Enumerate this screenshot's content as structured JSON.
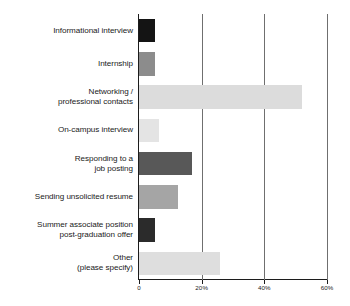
{
  "chart_data": {
    "type": "bar",
    "orientation": "horizontal",
    "title": "",
    "subtitle": "",
    "xlabel": "",
    "ylabel": "",
    "xlim": [
      0,
      60
    ],
    "grid": true,
    "legend": false,
    "legend_position": "none",
    "xtick_labels": [
      "0",
      "20%",
      "40%",
      "60%"
    ],
    "xtick_values": [
      0,
      20,
      40,
      60
    ],
    "categories": [
      "Informational interview",
      "Internship",
      "Networking /\nprofessional contacts",
      "On-campus interview",
      "Responding to a\njob posting",
      "Sending unsolicited resume",
      "Summer associate position\npost-graduation offer",
      "Other\n(please specify)"
    ],
    "values": [
      5,
      5,
      52,
      6.5,
      17,
      12.5,
      5,
      26
    ],
    "bar_colors": [
      "#141414",
      "#8c8c8c",
      "#dcdcdc",
      "#e4e4e4",
      "#585858",
      "#a5a5a5",
      "#2b2b2b",
      "#dedede"
    ],
    "axis_color": "#1c1c1c",
    "grid_color": "#6f6f6f",
    "background_color": "#ffffff"
  },
  "labels": {
    "items": [
      {
        "line1": "Informational interview",
        "line2": ""
      },
      {
        "line1": "Internship",
        "line2": ""
      },
      {
        "line1": "Networking /",
        "line2": "professional contacts"
      },
      {
        "line1": "On-campus interview",
        "line2": ""
      },
      {
        "line1": "Responding to a",
        "line2": "job posting"
      },
      {
        "line1": "Sending unsolicited resume",
        "line2": ""
      },
      {
        "line1": "Summer associate position",
        "line2": "post-graduation offer"
      },
      {
        "line1": "Other",
        "line2": "(please specify)"
      }
    ]
  },
  "axis": {
    "ticks": [
      {
        "label": "0",
        "value": 0
      },
      {
        "label": "20%",
        "value": 20
      },
      {
        "label": "40%",
        "value": 40
      },
      {
        "label": "60%",
        "value": 60
      }
    ]
  }
}
